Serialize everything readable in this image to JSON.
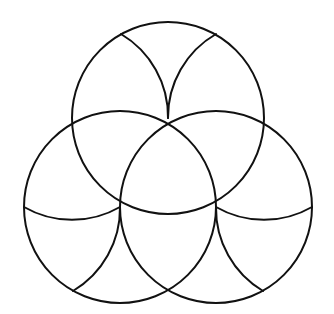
{
  "diagram": {
    "type": "geometric-pattern",
    "stroke_color": "#111111",
    "background_color": "#ffffff",
    "radius": 96,
    "circles": [
      {
        "id": "top",
        "cx": 168,
        "cy": 118
      },
      {
        "id": "left",
        "cx": 120,
        "cy": 207
      },
      {
        "id": "right",
        "cx": 216,
        "cy": 207
      }
    ],
    "petal_arcs": [
      {
        "id": "top-left-petal",
        "from": [
          121,
          34
        ],
        "to": [
          168,
          118
        ],
        "arc_center": [
          72,
          118
        ]
      },
      {
        "id": "top-right-petal",
        "from": [
          216,
          34
        ],
        "to": [
          168,
          118
        ],
        "arc_center": [
          264,
          118
        ]
      },
      {
        "id": "left-upper-petal",
        "from": [
          24,
          207
        ],
        "to": [
          120,
          207
        ],
        "arc_center": [
          72,
          123
        ]
      },
      {
        "id": "left-lower-petal",
        "from": [
          73,
          291
        ],
        "to": [
          120,
          207
        ],
        "arc_center": [
          24,
          207
        ]
      },
      {
        "id": "right-upper-petal",
        "from": [
          312,
          207
        ],
        "to": [
          216,
          207
        ],
        "arc_center": [
          264,
          123
        ]
      },
      {
        "id": "right-lower-petal",
        "from": [
          263,
          291
        ],
        "to": [
          216,
          207
        ],
        "arc_center": [
          312,
          207
        ]
      }
    ]
  }
}
